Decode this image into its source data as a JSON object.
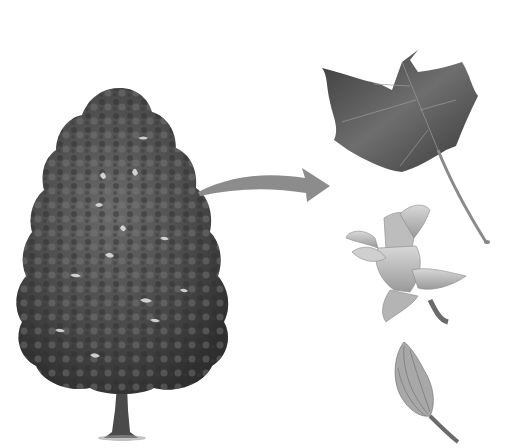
{
  "scene": {
    "description": "Grayscale botanical illustration of a tulip tree with an arrow pointing to its leaf, flower, and bud",
    "background": "#ffffff",
    "colors": {
      "foliage_dark": "#3a3a3a",
      "foliage_mid": "#5a5a5a",
      "foliage_light": "#8a8a8a",
      "trunk": "#4a4a4a",
      "arrow": "#8c8c8c",
      "leaf": "#555555",
      "leaf_vein": "#b0b0b0",
      "flower": "#c4c4c4",
      "bud": "#a8a8a8"
    },
    "elements": [
      "tree",
      "arrow",
      "leaf",
      "flower",
      "bud"
    ]
  }
}
